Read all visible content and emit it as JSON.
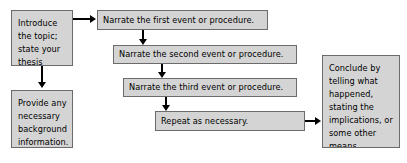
{
  "diagram": {
    "type": "flowchart",
    "colors": {
      "node_fill": "#d4d4d4",
      "node_border": "#6b6b6b",
      "connector": "#000000",
      "background": "#ffffff",
      "text": "#000000"
    },
    "nodes": [
      {
        "id": "introduce",
        "label": "Introduce the topic; state your thesis",
        "lines": [
          "Introduce",
          "the topic;",
          "state your",
          "thesis"
        ]
      },
      {
        "id": "background",
        "label": "Provide any necessary background information.",
        "lines": [
          "Provide any",
          "necessary",
          "background",
          "information."
        ]
      },
      {
        "id": "first-event",
        "label": "Narrate the first event or procedure.",
        "lines": [
          "Narrate the first event or procedure."
        ]
      },
      {
        "id": "second-event",
        "label": "Narrate the second event or procedure.",
        "lines": [
          "Narrate the second event or procedure."
        ]
      },
      {
        "id": "third-event",
        "label": "Narrate the third event or procedure.",
        "lines": [
          "Narrate the third event or procedure."
        ]
      },
      {
        "id": "repeat",
        "label": "Repeat as necessary.",
        "lines": [
          "Repeat as necessary."
        ]
      },
      {
        "id": "conclude",
        "label": "Conclude by telling what happened, stating the implications, or some other means.",
        "lines": [
          "Conclude by",
          "telling what",
          "happened,",
          "stating the",
          "implications, or",
          "some other",
          "means."
        ]
      }
    ],
    "connectors": [
      {
        "id": "introduce-to-first-event",
        "from": "introduce",
        "to": "first-event",
        "direction": "right"
      },
      {
        "id": "introduce-to-background",
        "from": "introduce",
        "to": "background",
        "direction": "down"
      },
      {
        "id": "first-to-second-event",
        "from": "first-event",
        "to": "second-event",
        "direction": "down"
      },
      {
        "id": "second-to-third-event",
        "from": "second-event",
        "to": "third-event",
        "direction": "down"
      },
      {
        "id": "third-event-to-repeat",
        "from": "third-event",
        "to": "repeat",
        "direction": "down"
      },
      {
        "id": "repeat-to-conclude",
        "from": "repeat",
        "to": "conclude",
        "direction": "right"
      }
    ]
  }
}
